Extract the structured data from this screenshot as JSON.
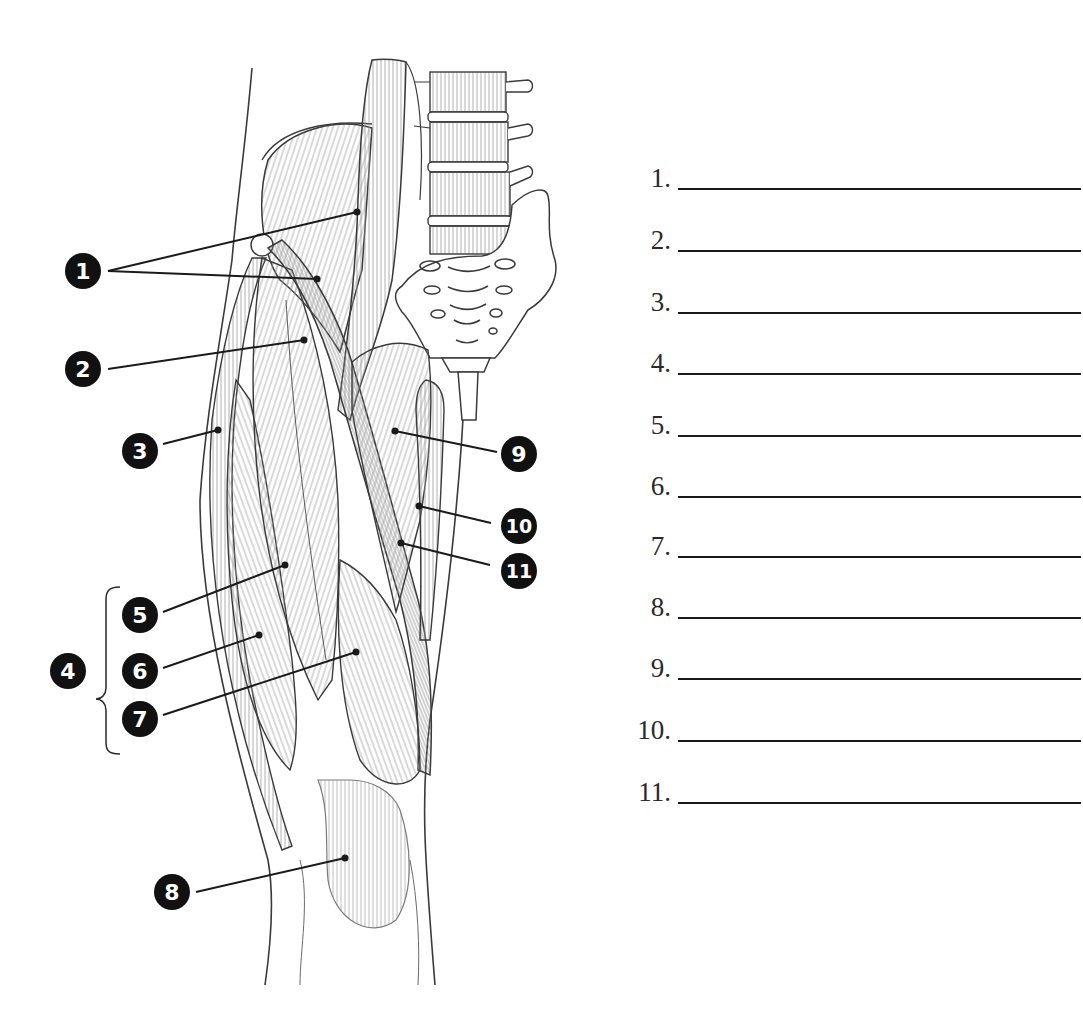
{
  "diagram": {
    "colors": {
      "outline": "#3a3a3a",
      "hatch": "#8a8a8a",
      "callout_fill": "#111111",
      "callout_text": "#ffffff",
      "leader": "#1a1a1a",
      "answer_line": "#1a1a1a"
    },
    "callouts": [
      {
        "id": "1",
        "label": "1"
      },
      {
        "id": "2",
        "label": "2"
      },
      {
        "id": "3",
        "label": "3"
      },
      {
        "id": "4",
        "label": "4"
      },
      {
        "id": "5",
        "label": "5"
      },
      {
        "id": "6",
        "label": "6"
      },
      {
        "id": "7",
        "label": "7"
      },
      {
        "id": "8",
        "label": "8"
      },
      {
        "id": "9",
        "label": "9"
      },
      {
        "id": "10",
        "label": "10"
      },
      {
        "id": "11",
        "label": "11"
      }
    ]
  },
  "answer_sheet": {
    "rows": [
      {
        "number": "1.",
        "value": ""
      },
      {
        "number": "2.",
        "value": ""
      },
      {
        "number": "3.",
        "value": ""
      },
      {
        "number": "4.",
        "value": ""
      },
      {
        "number": "5.",
        "value": ""
      },
      {
        "number": "6.",
        "value": ""
      },
      {
        "number": "7.",
        "value": ""
      },
      {
        "number": "8.",
        "value": ""
      },
      {
        "number": "9.",
        "value": ""
      },
      {
        "number": "10.",
        "value": ""
      },
      {
        "number": "11.",
        "value": ""
      }
    ]
  }
}
